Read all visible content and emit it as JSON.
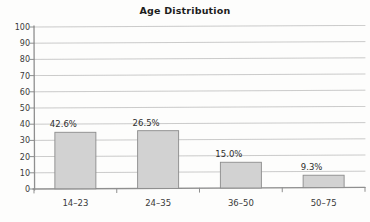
{
  "chart_data": {
    "type": "bar",
    "title": "Age Distribution",
    "xlabel": "",
    "ylabel": "",
    "categories": [
      "14–23",
      "24–35",
      "36–50",
      "50–75"
    ],
    "values": [
      35,
      36,
      16.5,
      8.5
    ],
    "data_labels": [
      "42.6%",
      "26.5%",
      "15.0%",
      "9.3%"
    ],
    "ylim": [
      0,
      100
    ],
    "ytick_labels": [
      "100",
      "90",
      "80",
      "70",
      "60",
      "50",
      "40",
      "30",
      "20",
      "10",
      "0"
    ],
    "ytick_values": [
      100,
      90,
      80,
      70,
      60,
      50,
      40,
      30,
      20,
      10,
      0
    ],
    "grid": "horizontal",
    "legend": "none",
    "bar_fill_color": "#d2d2d2",
    "bar_stroke_color": "#8c8c8c",
    "axis_color": "#8f8f8f",
    "grid_color": "#a9a9a9",
    "title_color": "#1d1d1d",
    "label_color": "#3a3a3a"
  }
}
